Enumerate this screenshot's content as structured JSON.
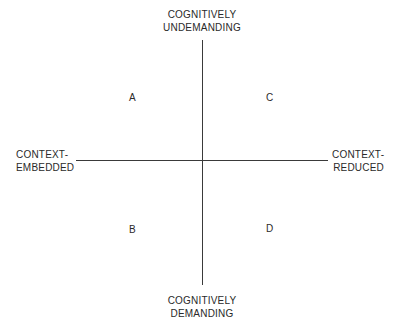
{
  "diagram": {
    "axes": {
      "vertical": {
        "top_label": [
          "COGNITIVELY",
          "UNDEMANDING"
        ],
        "bottom_label": [
          "COGNITIVELY",
          "DEMANDING"
        ]
      },
      "horizontal": {
        "left_label": [
          "CONTEXT-",
          "EMBEDDED"
        ],
        "right_label": [
          "CONTEXT-",
          "REDUCED"
        ]
      }
    },
    "quadrants": {
      "top_left": "A",
      "top_right": "C",
      "bottom_left": "B",
      "bottom_right": "D"
    },
    "colors": {
      "line": "#3a3a3a",
      "text": "#2a2a2a",
      "background": "#ffffff"
    }
  }
}
